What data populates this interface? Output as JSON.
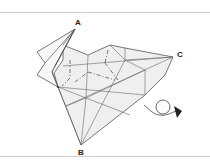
{
  "diagram": {
    "type": "origami-fold-step",
    "labels": {
      "a": "A",
      "b": "B",
      "c": "C"
    },
    "instruction_symbol": "turn-over-arrow",
    "colors": {
      "line": "#555555",
      "fill": "#efefef",
      "frame": "#cfcfcf",
      "label": "#222222"
    }
  }
}
